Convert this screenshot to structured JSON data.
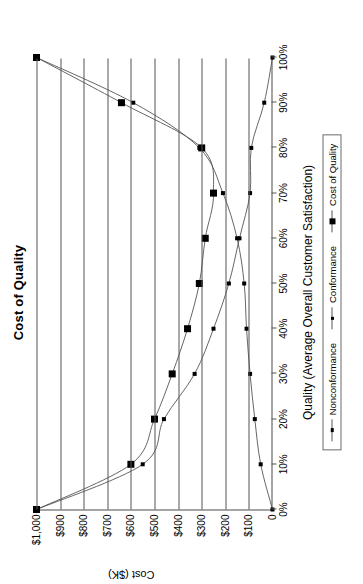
{
  "chart_data": {
    "type": "line",
    "title": "Cost of Quality",
    "xlabel": "Quality (Average Overall Customer Satisfaction)",
    "ylabel": "Cost ($K)",
    "x": [
      0,
      10,
      20,
      30,
      40,
      50,
      60,
      70,
      80,
      90,
      100
    ],
    "xtick_labels": [
      "0%",
      "10%",
      "20%",
      "30%",
      "40%",
      "50%",
      "60%",
      "70%",
      "80%",
      "90%",
      "100%"
    ],
    "ytick_labels": [
      "0",
      "$100",
      "$200",
      "$300",
      "$400",
      "$500",
      "$600",
      "$700",
      "$800",
      "$900",
      "$1,000"
    ],
    "ytick_values": [
      0,
      100,
      200,
      300,
      400,
      500,
      600,
      700,
      800,
      900,
      1000
    ],
    "xlim": [
      0,
      100
    ],
    "ylim": [
      0,
      1000
    ],
    "grid": "y-gridlines-only",
    "legend_position": "below-axis-center",
    "series": [
      {
        "name": "Nonconformance",
        "marker": "small-square",
        "values": [
          1000,
          550,
          460,
          330,
          250,
          185,
          140,
          95,
          90,
          35,
          0
        ]
      },
      {
        "name": "Conformance",
        "marker": "small-square",
        "values": [
          0,
          50,
          75,
          95,
          110,
          120,
          150,
          210,
          310,
          590,
          1000
        ]
      },
      {
        "name": "Cost of Quality",
        "marker": "large-filled-square",
        "values": [
          1000,
          600,
          500,
          425,
          360,
          310,
          285,
          250,
          300,
          640,
          1000
        ]
      }
    ]
  },
  "legend": {
    "items": [
      {
        "label": "Nonconformance"
      },
      {
        "label": "Conformance"
      },
      {
        "label": "Cost of Quality"
      }
    ]
  },
  "colors": {
    "axis": "#4a4a4a",
    "gridline": "#555555",
    "series_line": "#555555",
    "marker": "#000000",
    "background": "#ffffff"
  }
}
